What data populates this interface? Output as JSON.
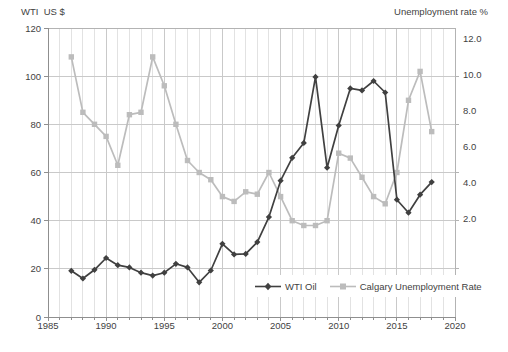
{
  "chart_data": {
    "type": "line",
    "title": "",
    "grid": "on",
    "x": [
      1987,
      1988,
      1989,
      1990,
      1991,
      1992,
      1993,
      1994,
      1995,
      1996,
      1997,
      1998,
      1999,
      2000,
      2001,
      2002,
      2003,
      2004,
      2005,
      2006,
      2007,
      2008,
      2009,
      2010,
      2011,
      2012,
      2013,
      2014,
      2015,
      2016,
      2017,
      2018
    ],
    "series": [
      {
        "name": "WTI Oil",
        "axis": "left",
        "color": "#404040",
        "marker": "diamond",
        "values": [
          19.2,
          16.0,
          19.6,
          24.5,
          21.5,
          20.6,
          18.4,
          17.2,
          18.4,
          22.1,
          20.6,
          14.4,
          19.3,
          30.4,
          26.0,
          26.2,
          31.1,
          41.5,
          56.6,
          66.1,
          72.3,
          99.7,
          62.0,
          79.5,
          94.9,
          94.1,
          98.0,
          93.2,
          48.7,
          43.3,
          50.8,
          56.0
        ]
      },
      {
        "name": "Calgary Unemployment Rate",
        "axis": "right",
        "color": "#bcbcbc",
        "marker": "square",
        "values": [
          10.8,
          8.5,
          8.0,
          7.5,
          6.3,
          8.4,
          8.5,
          10.8,
          9.6,
          8.0,
          6.5,
          6.0,
          5.7,
          5.0,
          4.8,
          5.2,
          5.1,
          6.0,
          5.0,
          4.0,
          3.8,
          3.8,
          4.0,
          6.8,
          6.6,
          5.8,
          5.0,
          4.7,
          6.0,
          9.0,
          10.2,
          7.7
        ]
      }
    ],
    "left_axis": {
      "title": "WTI  US $",
      "range": [
        0,
        120
      ],
      "ticks": [
        "120",
        "100",
        "80",
        "60",
        "40",
        "20",
        "0"
      ]
    },
    "right_axis": {
      "title": "Unemployment rate %",
      "range": [
        0,
        12
      ],
      "ticks": [
        "12.0",
        "10.0",
        "8.0",
        "6.0",
        "4.0",
        "2.0"
      ]
    },
    "x_axis": {
      "range": [
        1985,
        2020
      ],
      "tick_labels": [
        "1985",
        "1990",
        "1995",
        "2000",
        "2005",
        "2010",
        "2015",
        "2020"
      ]
    },
    "legend": {
      "position": "inside-bottom-right",
      "items": [
        "WTI Oil",
        "Calgary Unemployment Rate"
      ]
    },
    "colors": {
      "gridline_major": "#c9c9c9",
      "gridline_minor": "#e2e2e2",
      "plot_border": "#b3b3b3",
      "axis_line": "#8f8f8f",
      "text": "#3f3f3f",
      "background": "#ffffff"
    }
  }
}
